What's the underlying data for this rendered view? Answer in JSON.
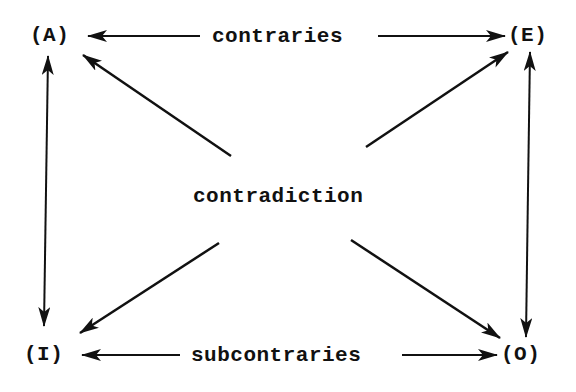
{
  "diagram": {
    "colors": {
      "ink": "#111111",
      "background": "#ffffff"
    },
    "nodes": [
      {
        "id": "A",
        "label": "(A)"
      },
      {
        "id": "E",
        "label": "(E)"
      },
      {
        "id": "I",
        "label": "(I)"
      },
      {
        "id": "O",
        "label": "(O)"
      }
    ],
    "relations": {
      "top": "contraries",
      "bottom": "subcontraries",
      "center": "contradiction"
    },
    "edges": [
      {
        "from": "A",
        "to": "E",
        "label": "contraries",
        "direction": "both"
      },
      {
        "from": "I",
        "to": "O",
        "label": "subcontraries",
        "direction": "both"
      },
      {
        "from": "A",
        "to": "I",
        "label": "",
        "direction": "both"
      },
      {
        "from": "E",
        "to": "O",
        "label": "",
        "direction": "both"
      },
      {
        "from": "A",
        "to": "O",
        "label": "contradiction",
        "direction": "both"
      },
      {
        "from": "E",
        "to": "I",
        "label": "contradiction",
        "direction": "both"
      }
    ]
  }
}
